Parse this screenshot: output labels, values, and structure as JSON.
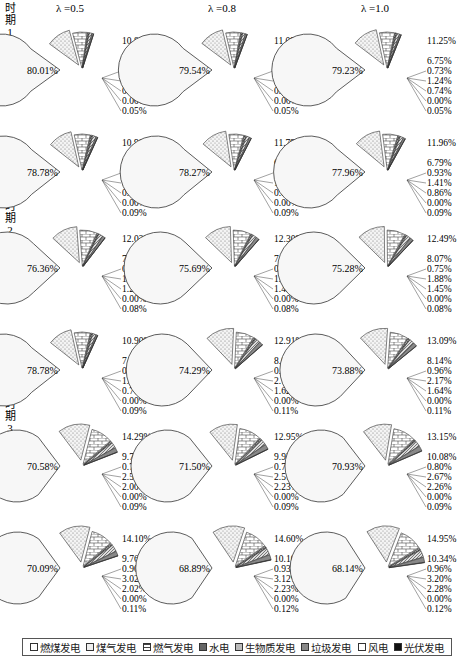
{
  "chart_data": {
    "type": "pie",
    "title": "",
    "column_headers": [
      "λ =0.5",
      "λ =0.8",
      "λ =1.0"
    ],
    "period_labels": [
      "时期1",
      "时期2",
      "时期3"
    ],
    "bound_labels": {
      "lower": "下限",
      "upper": "上限"
    },
    "legend": [
      "燃煤发电",
      "煤气发电",
      "燃气发电",
      "水电",
      "生物质发电",
      "垃圾发电",
      "风电",
      "光伏发电"
    ],
    "rows": [
      {
        "period": "时期1",
        "bound": "下限",
        "charts": [
          {
            "lambda": "0.5",
            "values": [
              80.01,
              10.85,
              6.51,
              0.71,
              1.2,
              0.69,
              0.0,
              0.05
            ]
          },
          {
            "lambda": "0.8",
            "values": [
              79.54,
              11.09,
              6.65,
              0.72,
              1.22,
              0.73,
              0.0,
              0.05
            ]
          },
          {
            "lambda": "1.0",
            "values": [
              79.23,
              11.25,
              6.75,
              0.73,
              1.24,
              0.74,
              0.0,
              0.05
            ]
          }
        ]
      },
      {
        "period": "时期1",
        "bound": "上限",
        "charts": [
          {
            "lambda": "0.5",
            "values": [
              78.78,
              10.9,
              7.15,
              0.9,
              1.48,
              0.71,
              0.0,
              0.09
            ]
          },
          {
            "lambda": "0.8",
            "values": [
              78.27,
              11.79,
              6.69,
              0.92,
              1.39,
              0.85,
              0.0,
              0.09
            ]
          },
          {
            "lambda": "1.0",
            "values": [
              77.96,
              11.96,
              6.79,
              0.93,
              1.41,
              0.86,
              0.0,
              0.09
            ]
          }
        ]
      },
      {
        "period": "时期2",
        "bound": "下限",
        "charts": [
          {
            "lambda": "0.5",
            "values": [
              76.36,
              12.03,
              7.77,
              0.72,
              1.81,
              1.23,
              0.0,
              0.08
            ]
          },
          {
            "lambda": "0.8",
            "values": [
              75.69,
              12.3,
              7.95,
              0.73,
              1.82,
              1.43,
              0.0,
              0.08
            ]
          },
          {
            "lambda": "1.0",
            "values": [
              75.28,
              12.49,
              8.07,
              0.75,
              1.88,
              1.45,
              0.0,
              0.08
            ]
          }
        ]
      },
      {
        "period": "时期2",
        "bound": "上限",
        "charts": [
          {
            "lambda": "0.5",
            "values": [
              78.78,
              10.9,
              7.15,
              0.9,
              1.48,
              0.71,
              0.0,
              0.09
            ]
          },
          {
            "lambda": "0.8",
            "values": [
              74.29,
              12.91,
              8.02,
              0.95,
              2.1,
              1.62,
              0.0,
              0.11
            ]
          },
          {
            "lambda": "1.0",
            "values": [
              73.88,
              13.09,
              8.14,
              0.96,
              2.17,
              1.64,
              0.0,
              0.11
            ]
          }
        ]
      },
      {
        "period": "时期3",
        "bound": "下限",
        "charts": [
          {
            "lambda": "0.5",
            "values": [
              70.58,
              14.29,
              9.7,
              0.77,
              2.57,
              2.0,
              0.0,
              0.09
            ]
          },
          {
            "lambda": "0.8",
            "values": [
              71.5,
              12.95,
              9.93,
              0.79,
              2.51,
              2.23,
              0.0,
              0.09
            ]
          },
          {
            "lambda": "1.0",
            "values": [
              70.93,
              13.15,
              10.08,
              0.8,
              2.67,
              2.26,
              0.0,
              0.09
            ]
          }
        ]
      },
      {
        "period": "时期3",
        "bound": "上限",
        "charts": [
          {
            "lambda": "0.5",
            "values": [
              70.09,
              14.1,
              9.76,
              0.9,
              3.02,
              2.02,
              0.0,
              0.11
            ]
          },
          {
            "lambda": "0.8",
            "values": [
              68.89,
              14.6,
              10.1,
              0.93,
              3.12,
              2.23,
              0.0,
              0.12
            ]
          },
          {
            "lambda": "1.0",
            "values": [
              68.14,
              14.95,
              10.34,
              0.96,
              3.2,
              2.28,
              0.0,
              0.12
            ]
          }
        ]
      }
    ]
  },
  "side_labels": [
    {
      "period": "时\n期\n1",
      "bound": "下\n限"
    },
    {
      "bound": "上\n限"
    },
    {
      "period": "时\n期\n2",
      "bound": "下\n限"
    },
    {
      "bound": "上\n限"
    },
    {
      "period": "时\n期\n3",
      "bound": "下\n限"
    },
    {
      "bound": "上\n限"
    }
  ]
}
